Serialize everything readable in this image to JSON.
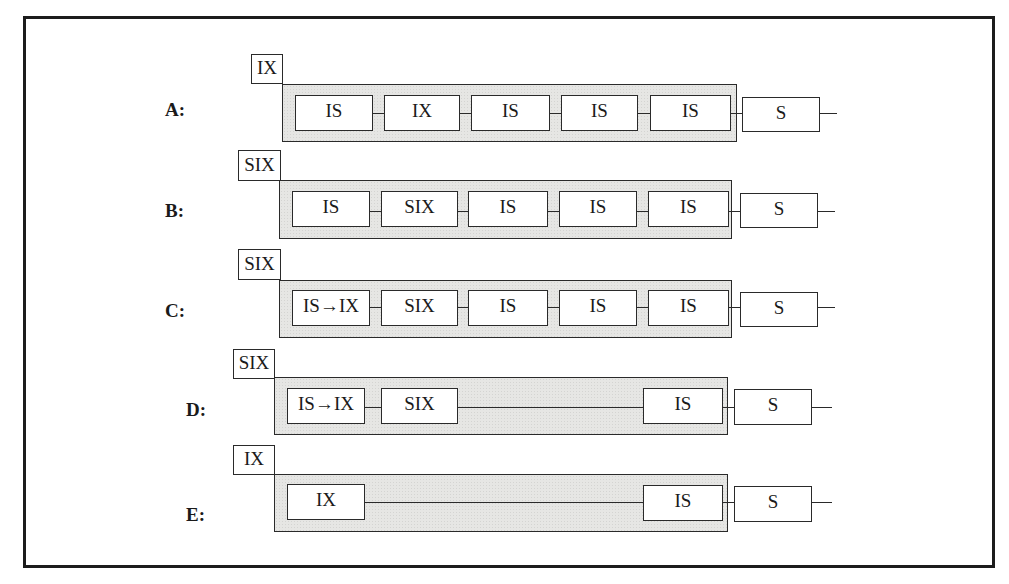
{
  "diagram": {
    "type": "lock-hierarchy-rows",
    "rows": [
      {
        "id": "A",
        "label": "A:",
        "label_pos": [
          165,
          100
        ],
        "parent_lock": {
          "text": "IX",
          "box": [
            251,
            54,
            32,
            30
          ]
        },
        "group_box": [
          282,
          84,
          455,
          58
        ],
        "nodes": [
          {
            "text": "IS",
            "box": [
              295,
              95,
              78,
              36
            ]
          },
          {
            "text": "IX",
            "box": [
              384,
              95,
              76,
              36
            ]
          },
          {
            "text": "IS",
            "box": [
              471,
              95,
              79,
              36
            ]
          },
          {
            "text": "IS",
            "box": [
              561,
              95,
              77,
              36
            ]
          },
          {
            "text": "IS",
            "box": [
              650,
              95,
              81,
              36
            ]
          }
        ],
        "outside_node": {
          "text": "S",
          "box": [
            742,
            97,
            78,
            35
          ]
        },
        "wire_y": 113,
        "tail": [
          820,
          837
        ]
      },
      {
        "id": "B",
        "label": "B:",
        "label_pos": [
          165,
          201
        ],
        "parent_lock": {
          "text": "SIX",
          "box": [
            238,
            150,
            43,
            31
          ]
        },
        "group_box": [
          279,
          180,
          453,
          59
        ],
        "nodes": [
          {
            "text": "IS",
            "box": [
              292,
              191,
              78,
              36
            ]
          },
          {
            "text": "SIX",
            "box": [
              381,
              191,
              77,
              36
            ]
          },
          {
            "text": "IS",
            "box": [
              468,
              191,
              80,
              36
            ]
          },
          {
            "text": "IS",
            "box": [
              559,
              191,
              78,
              36
            ]
          },
          {
            "text": "IS",
            "box": [
              648,
              191,
              81,
              36
            ]
          }
        ],
        "outside_node": {
          "text": "S",
          "box": [
            740,
            193,
            78,
            35
          ]
        },
        "wire_y": 211,
        "tail": [
          818,
          835
        ]
      },
      {
        "id": "C",
        "label": "C:",
        "label_pos": [
          165,
          301
        ],
        "parent_lock": {
          "text": "SIX",
          "box": [
            238,
            249,
            43,
            31
          ]
        },
        "group_box": [
          279,
          280,
          453,
          58
        ],
        "nodes": [
          {
            "text": "IS→IX",
            "box": [
              292,
              290,
              78,
              36
            ]
          },
          {
            "text": "SIX",
            "box": [
              381,
              290,
              77,
              36
            ]
          },
          {
            "text": "IS",
            "box": [
              468,
              290,
              80,
              36
            ]
          },
          {
            "text": "IS",
            "box": [
              559,
              290,
              78,
              36
            ]
          },
          {
            "text": "IS",
            "box": [
              648,
              290,
              81,
              36
            ]
          }
        ],
        "outside_node": {
          "text": "S",
          "box": [
            740,
            292,
            78,
            35
          ]
        },
        "wire_y": 307,
        "tail": [
          818,
          835
        ]
      },
      {
        "id": "D",
        "label": "D:",
        "label_pos": [
          186,
          400
        ],
        "parent_lock": {
          "text": "SIX",
          "box": [
            233,
            349,
            42,
            30
          ]
        },
        "group_box": [
          274,
          377,
          454,
          58
        ],
        "nodes": [
          {
            "text": "IS→IX",
            "box": [
              287,
              388,
              78,
              36
            ]
          },
          {
            "text": "SIX",
            "box": [
              381,
              388,
              77,
              36
            ]
          },
          {
            "text": "IS",
            "box": [
              643,
              388,
              80,
              36
            ]
          }
        ],
        "outside_node": {
          "text": "S",
          "box": [
            734,
            389,
            78,
            36
          ]
        },
        "wire_y": 407,
        "tail": [
          812,
          832
        ]
      },
      {
        "id": "E",
        "label": "E:",
        "label_pos": [
          186,
          505
        ],
        "parent_lock": {
          "text": "IX",
          "box": [
            233,
            445,
            42,
            30
          ]
        },
        "group_box": [
          274,
          474,
          454,
          58
        ],
        "nodes": [
          {
            "text": "IX",
            "box": [
              287,
              484,
              78,
              36
            ]
          },
          {
            "text": "IS",
            "box": [
              643,
              485,
              80,
              36
            ]
          }
        ],
        "outside_node": {
          "text": "S",
          "box": [
            734,
            486,
            78,
            36
          ]
        },
        "wire_y": 502,
        "tail": [
          812,
          832
        ]
      }
    ]
  }
}
